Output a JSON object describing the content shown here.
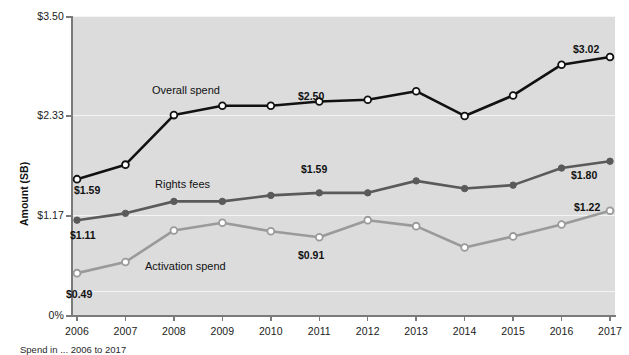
{
  "chart_data": {
    "type": "line",
    "title": "",
    "xlabel": "",
    "ylabel": "Amount (SB)",
    "grid": true,
    "legend": "inline-labels",
    "ylim": [
      0,
      3.5
    ],
    "ytick_values": [
      0,
      1.17,
      2.33,
      3.5
    ],
    "ytick_labels": [
      "0%",
      "$1.17",
      "$2.33",
      "$3.50"
    ],
    "categories": [
      "2006",
      "2007",
      "2008",
      "2009",
      "2010",
      "2011",
      "2012",
      "2013",
      "2014",
      "2015",
      "2016",
      "2017"
    ],
    "series": [
      {
        "name": "Overall spend",
        "color": "#111111",
        "marker": "open-circle",
        "values": [
          1.59,
          1.76,
          2.34,
          2.45,
          2.45,
          2.5,
          2.52,
          2.62,
          2.33,
          2.57,
          2.93,
          3.02
        ],
        "endpoint_labels": [
          {
            "category": "2006",
            "value": 1.59,
            "text": "$1.59"
          },
          {
            "category": "2011",
            "value": 2.5,
            "text": "$2.50"
          },
          {
            "category": "2017",
            "value": 3.02,
            "text": "$3.02"
          }
        ]
      },
      {
        "name": "Rights fees",
        "color": "#5a5a5a",
        "marker": "filled-circle",
        "values": [
          1.11,
          1.19,
          1.33,
          1.33,
          1.4,
          1.43,
          1.43,
          1.57,
          1.48,
          1.52,
          1.72,
          1.8
        ],
        "endpoint_labels": [
          {
            "category": "2006",
            "value": 1.11,
            "text": "$1.11"
          },
          {
            "category": "2011",
            "value": 1.43,
            "text": "$1.59"
          },
          {
            "category": "2017",
            "value": 1.8,
            "text": "$1.80"
          }
        ]
      },
      {
        "name": "Activation spend",
        "color": "#9a9a9a",
        "marker": "open-circle",
        "values": [
          0.49,
          0.62,
          0.99,
          1.08,
          0.98,
          0.91,
          1.11,
          1.04,
          0.79,
          0.92,
          1.06,
          1.22
        ],
        "endpoint_labels": [
          {
            "category": "2006",
            "value": 0.49,
            "text": "$0.49"
          },
          {
            "category": "2011",
            "value": 0.91,
            "text": "$0.91"
          },
          {
            "category": "2017",
            "value": 1.22,
            "text": "$1.22"
          }
        ]
      }
    ],
    "series_name_labels": [
      {
        "text": "Overall spend",
        "x_px": 152,
        "y_px": 84
      },
      {
        "text": "Rights fees",
        "x_px": 155,
        "y_px": 178
      },
      {
        "text": "Activation spend",
        "x_px": 145,
        "y_px": 260
      }
    ],
    "value_labels": [
      {
        "text": "$1.59",
        "x_px": 74,
        "y_px": 184,
        "series": "Overall spend"
      },
      {
        "text": "$2.50",
        "x_px": 298,
        "y_px": 90,
        "series": "Overall spend"
      },
      {
        "text": "$3.02",
        "x_px": 573,
        "y_px": 43,
        "series": "Overall spend"
      },
      {
        "text": "$1.11",
        "x_px": 70,
        "y_px": 229,
        "series": "Rights fees"
      },
      {
        "text": "$1.59",
        "x_px": 301,
        "y_px": 163,
        "series": "Rights fees"
      },
      {
        "text": "$1.80",
        "x_px": 571,
        "y_px": 169,
        "series": "Rights fees"
      },
      {
        "text": "$0.49",
        "x_px": 66,
        "y_px": 288,
        "series": "Activation spend"
      },
      {
        "text": "$0.91",
        "x_px": 298,
        "y_px": 249,
        "series": "Activation spend"
      },
      {
        "text": "$1.22",
        "x_px": 574,
        "y_px": 201,
        "series": "Activation spend"
      }
    ]
  },
  "axis": {
    "y_title": "Amount (SB)",
    "y_ticks": [
      "$3.50",
      "$2.33",
      "$1.17",
      "0%"
    ],
    "x_ticks": [
      "2006",
      "2007",
      "2008",
      "2009",
      "2010",
      "2011",
      "2012",
      "2013",
      "2014",
      "2015",
      "2016",
      "2017"
    ]
  },
  "caption": {
    "text": "Spend in ... 2006 to 2017"
  }
}
